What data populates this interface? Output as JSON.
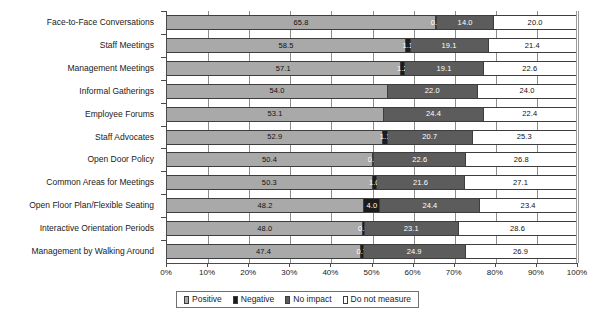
{
  "chart_data": {
    "type": "bar",
    "subtype": "100% stacked horizontal bar",
    "title": "",
    "subtitle": "",
    "xlabel": "",
    "ylabel": "",
    "xlim": [
      0,
      100
    ],
    "xticks": [
      "0%",
      "10%",
      "20%",
      "30%",
      "40%",
      "50%",
      "60%",
      "70%",
      "80%",
      "90%",
      "100%"
    ],
    "xtick_values": [
      0,
      10,
      20,
      30,
      40,
      50,
      60,
      70,
      80,
      90,
      100
    ],
    "grid": true,
    "legend_position": "bottom",
    "orientation": "horizontal",
    "categories": [
      "Face-to-Face Conversations",
      "Staff Meetings",
      "Management Meetings",
      "Informal Gatherings",
      "Employee Forums",
      "Staff Advocates",
      "Open Door Policy",
      "Common Areas for Meetings",
      "Open Floor Plan/Flexible Seating",
      "Interactive Orientation Periods",
      "Management by Walking Around"
    ],
    "series": [
      {
        "name": "Positive",
        "color": "#a9a9a9",
        "values": [
          65.8,
          58.5,
          57.1,
          54.0,
          53.1,
          52.9,
          50.4,
          50.3,
          48.2,
          48.0,
          47.4
        ]
      },
      {
        "name": "Negative",
        "color": "#1c1c1c",
        "values": [
          0.2,
          1.1,
          1.2,
          0.0,
          0.0,
          1.1,
          0.2,
          1.0,
          4.0,
          0.3,
          0.7
        ]
      },
      {
        "name": "No impact",
        "color": "#5c5c5c",
        "values": [
          14.0,
          19.1,
          19.1,
          22.0,
          24.4,
          20.7,
          22.6,
          21.6,
          24.4,
          23.1,
          24.9
        ]
      },
      {
        "name": "Do not measure",
        "color": "#ffffff",
        "values": [
          20.0,
          21.4,
          22.6,
          24.0,
          22.4,
          25.3,
          26.8,
          27.1,
          23.4,
          28.6,
          26.9
        ]
      }
    ],
    "data_labels": [
      {
        "category": "Face-to-Face Conversations",
        "Positive": "65.8",
        "Negative": "0.2",
        "No impact": "14.0",
        "Do not measure": "20.0"
      },
      {
        "category": "Staff Meetings",
        "Positive": "58.5",
        "Negative": "1.1",
        "No impact": "19.1",
        "Do not measure": "21.4"
      },
      {
        "category": "Management Meetings",
        "Positive": "57.1",
        "Negative": "1.2",
        "No impact": "19.1",
        "Do not measure": "22.6"
      },
      {
        "category": "Informal Gatherings",
        "Positive": "54.0",
        "Negative": "",
        "No impact": "22.0",
        "Do not measure": "24.0"
      },
      {
        "category": "Employee Forums",
        "Positive": "53.1",
        "Negative": "",
        "No impact": "24.4",
        "Do not measure": "22.4"
      },
      {
        "category": "Staff Advocates",
        "Positive": "52.9",
        "Negative": "1.1",
        "No impact": "20.7",
        "Do not measure": "25.3"
      },
      {
        "category": "Open Door Policy",
        "Positive": "50.4",
        "Negative": "0.2",
        "No impact": "22.6",
        "Do not measure": "26.8"
      },
      {
        "category": "Common Areas for Meetings",
        "Positive": "50.3",
        "Negative": "1.0",
        "No impact": "21.6",
        "Do not measure": "27.1"
      },
      {
        "category": "Open Floor Plan/Flexible Seating",
        "Positive": "48.2",
        "Negative": "4.0",
        "No impact": "24.4",
        "Do not measure": "23.4"
      },
      {
        "category": "Interactive Orientation Periods",
        "Positive": "48.0",
        "Negative": "0.3",
        "No impact": "23.1",
        "Do not measure": "28.6"
      },
      {
        "category": "Management by Walking Around",
        "Positive": "47.4",
        "Negative": "0.7",
        "No impact": "24.9",
        "Do not measure": "26.9"
      }
    ],
    "legend": [
      {
        "label": "Positive",
        "color": "#a9a9a9"
      },
      {
        "label": "Negative",
        "color": "#1c1c1c"
      },
      {
        "label": "No impact",
        "color": "#5c5c5c"
      },
      {
        "label": "Do not measure",
        "color": "#ffffff"
      }
    ]
  }
}
